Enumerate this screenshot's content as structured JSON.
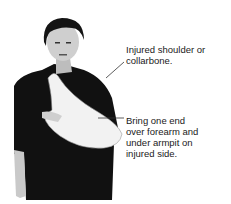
{
  "figure": {
    "callouts": [
      {
        "text": "Injured shoulder or\ncollarbone."
      },
      {
        "text": "Bring one end\nover forearm and\nunder armpit on\ninjured side."
      }
    ]
  }
}
